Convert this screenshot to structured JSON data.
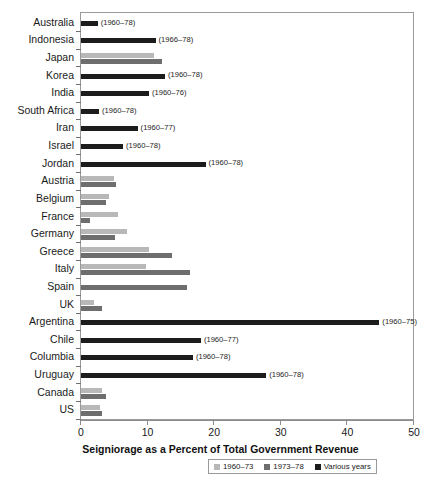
{
  "chart_data": {
    "type": "bar",
    "orientation": "horizontal",
    "title": "",
    "xlabel": "Seigniorage as a Percent of Total Government Revenue",
    "ylabel": "",
    "xlim": [
      0,
      50
    ],
    "xticks": [
      0,
      10,
      20,
      30,
      40,
      50
    ],
    "xtick_labels": [
      "0",
      "10",
      "20",
      "30",
      "40",
      "50"
    ],
    "grid": false,
    "legend_position": "bottom-center",
    "categories": [
      "Australia",
      "Indonesia",
      "Japan",
      "Korea",
      "India",
      "South Africa",
      "Iran",
      "Israel",
      "Jordan",
      "Austria",
      "Belgium",
      "France",
      "Germany",
      "Greece",
      "Italy",
      "Spain",
      "UK",
      "Argentina",
      "Chile",
      "Columbia",
      "Uruguay",
      "Canada",
      "US"
    ],
    "series": [
      {
        "name": "1960–73",
        "color": "#b8b8b8",
        "values": [
          null,
          null,
          11.0,
          null,
          null,
          null,
          null,
          null,
          null,
          4.9,
          4.2,
          5.5,
          6.9,
          10.2,
          9.7,
          null,
          1.9,
          null,
          null,
          null,
          null,
          3.1,
          2.8
        ]
      },
      {
        "name": "1973–78",
        "color": "#6e6e6e",
        "values": [
          null,
          null,
          12.1,
          null,
          null,
          null,
          null,
          null,
          null,
          5.2,
          3.7,
          1.3,
          5.1,
          13.6,
          16.3,
          15.9,
          3.1,
          null,
          null,
          null,
          null,
          3.7,
          3.1
        ]
      },
      {
        "name": "Various years",
        "color": "#1c1c1c",
        "values": [
          2.5,
          11.2,
          null,
          12.6,
          10.2,
          2.7,
          8.5,
          6.3,
          18.7,
          null,
          null,
          null,
          null,
          null,
          null,
          null,
          null,
          44.8,
          18.0,
          16.8,
          27.8,
          null,
          null
        ]
      }
    ],
    "bar_annotations": {
      "Australia": "(1960–78)",
      "Indonesia": "(1966–78)",
      "Korea": "(1960–78)",
      "India": "(1960–76)",
      "South Africa": "(1960–78)",
      "Iran": "(1960–77)",
      "Israel": "(1960–78)",
      "Jordan": "(1960–78)",
      "Argentina": "(1960–75)",
      "Chile": "(1960–77)",
      "Columbia": "(1960–78)",
      "Uruguay": "(1960–78)"
    }
  },
  "legend": {
    "items": [
      {
        "label": "1960–73",
        "color": "#b8b8b8"
      },
      {
        "label": "1973–78",
        "color": "#6e6e6e"
      },
      {
        "label": "Various years",
        "color": "#1c1c1c"
      }
    ]
  }
}
